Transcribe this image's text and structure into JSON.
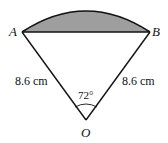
{
  "diagram": {
    "type": "sector-with-shaded-segment",
    "points": {
      "A": "A",
      "B": "B",
      "O": "O"
    },
    "left_radius_label": "8.6 cm",
    "right_radius_label": "8.6 cm",
    "angle_label": "72°",
    "shaded_region": "segment between chord AB and arc AB",
    "colors": {
      "shade": "#9e9e9e",
      "stroke": "#111111"
    }
  }
}
